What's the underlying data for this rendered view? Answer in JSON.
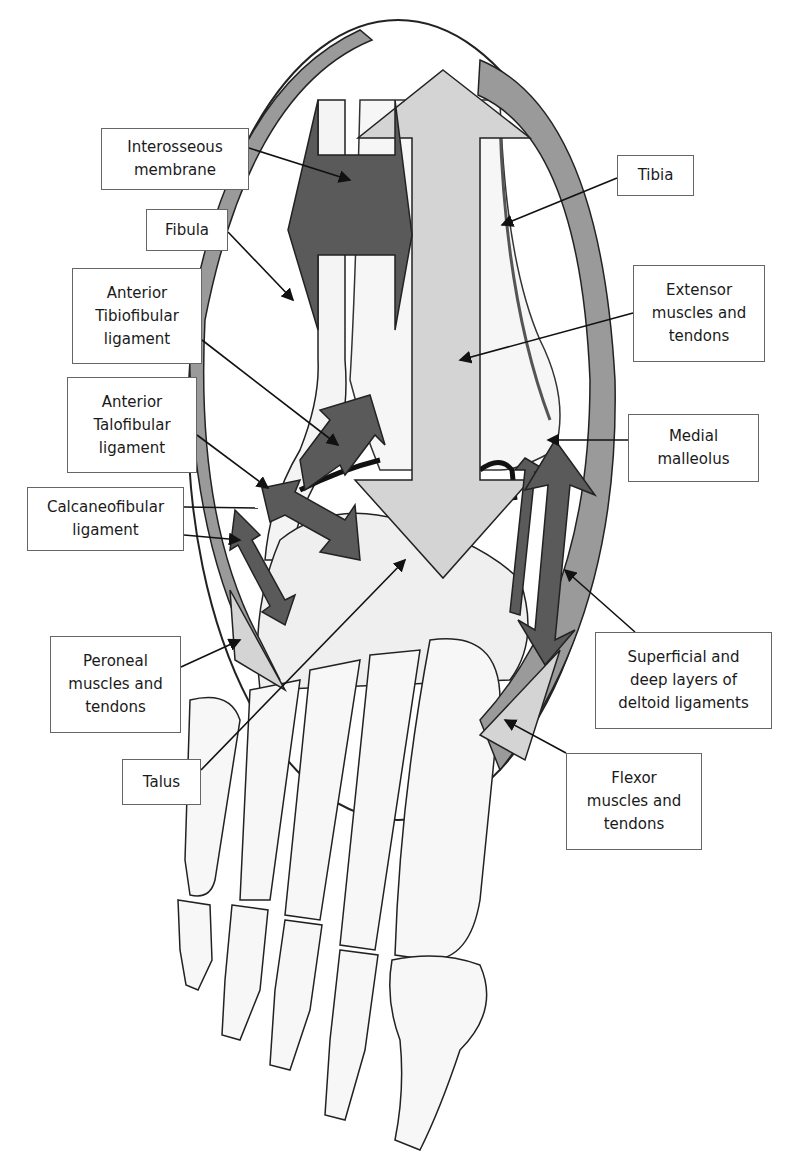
{
  "figure": {
    "colors": {
      "dark_arrow": "#5a5a5a",
      "light_arrow": "#d4d4d4",
      "curved_band": "#9a9a9a",
      "outline": "#222222",
      "bone_fill": "#f4f4f4",
      "label_border": "#666666"
    }
  },
  "labels": [
    {
      "id": "interosseous-membrane",
      "text": "Interosseous\nmembrane",
      "box": [
        101,
        128,
        148,
        62
      ]
    },
    {
      "id": "fibula",
      "text": "Fibula",
      "box": [
        146,
        209,
        82,
        42
      ]
    },
    {
      "id": "anterior-tibiofibular-ligament",
      "text": "Anterior\nTibiofibular\nligament",
      "box": [
        72,
        268,
        130,
        96
      ]
    },
    {
      "id": "anterior-talofibular-ligament",
      "text": "Anterior\nTalofibular\nligament",
      "box": [
        67,
        377,
        130,
        96
      ]
    },
    {
      "id": "calcaneofibular-ligament",
      "text": "Calcaneofibular\nligament",
      "box": [
        27,
        487,
        157,
        64
      ]
    },
    {
      "id": "peroneal-muscles-and-tendons",
      "text": "Peroneal\nmuscles and\ntendons",
      "box": [
        50,
        636,
        131,
        97
      ]
    },
    {
      "id": "talus",
      "text": "Talus",
      "box": [
        122,
        759,
        79,
        46
      ]
    },
    {
      "id": "tibia",
      "text": "Tibia",
      "box": [
        617,
        155,
        77,
        41
      ]
    },
    {
      "id": "extensor-muscles-and-tendons",
      "text": "Extensor\nmuscles and\ntendons",
      "box": [
        633,
        265,
        132,
        97
      ]
    },
    {
      "id": "medial-malleolus",
      "text": "Medial\nmalleolus",
      "box": [
        628,
        414,
        131,
        68
      ]
    },
    {
      "id": "superficial-and-deep-deltoid-ligaments",
      "text": "Superficial and\ndeep layers of\ndeltoid ligaments",
      "box": [
        595,
        632,
        177,
        97
      ]
    },
    {
      "id": "flexor-muscles-and-tendons",
      "text": "Flexor\nmuscles and\ntendons",
      "box": [
        566,
        753,
        136,
        97
      ]
    }
  ]
}
